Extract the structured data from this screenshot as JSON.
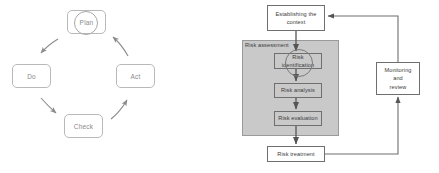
{
  "pdca": {
    "title": "PDCA cycle",
    "boxes": [
      {
        "id": "plan",
        "label": "Plan",
        "highlighted": true
      },
      {
        "id": "do",
        "label": "Do",
        "highlighted": false
      },
      {
        "id": "check",
        "label": "Check",
        "highlighted": false
      },
      {
        "id": "act",
        "label": "Act",
        "highlighted": false
      }
    ],
    "arrows": [
      {
        "from": "Plan",
        "to": "Do"
      },
      {
        "from": "Do",
        "to": "Check"
      },
      {
        "from": "Check",
        "to": "Act"
      },
      {
        "from": "Act",
        "to": "Plan"
      }
    ],
    "annotation": {
      "shape": "circle",
      "target": "Plan"
    },
    "colors": {
      "box_border": "#b9b9b9",
      "text": "#8a8a8a",
      "arrow": "#8a8a8a",
      "circle": "#a8a8a8"
    }
  },
  "risk": {
    "title": "Risk management process",
    "boxes": [
      {
        "id": "context",
        "label": "Establishing the\ncontext",
        "shaded": false
      },
      {
        "id": "ident",
        "label": "Risk\nidentification",
        "shaded": true
      },
      {
        "id": "analysis",
        "label": "Risk analysis",
        "shaded": true
      },
      {
        "id": "eval",
        "label": "Risk evaluation",
        "shaded": true
      },
      {
        "id": "treat",
        "label": "Risk treatment",
        "shaded": false
      },
      {
        "id": "monitor",
        "label": "Monitoring\nand\nreview",
        "shaded": false
      }
    ],
    "panel": {
      "label": "Risk assessment",
      "fill": "#c9c9c9"
    },
    "annotation": {
      "shape": "circle",
      "target": "Risk identification"
    },
    "arrows": [
      {
        "from": "Establishing the context",
        "to": "Risk identification"
      },
      {
        "from": "Risk identification",
        "to": "Risk analysis"
      },
      {
        "from": "Risk analysis",
        "to": "Risk evaluation"
      },
      {
        "from": "Risk evaluation",
        "to": "Risk treatment"
      },
      {
        "from": "Risk treatment",
        "to": "Monitoring and review"
      },
      {
        "from": "Monitoring and review",
        "to": "Establishing the context"
      }
    ],
    "colors": {
      "box_border": "#6f6f6f",
      "text": "#3b3b3b",
      "line": "#6f6f6f",
      "panel_fill": "#c9c9c9",
      "panel_border": "#9a9a9a"
    }
  }
}
